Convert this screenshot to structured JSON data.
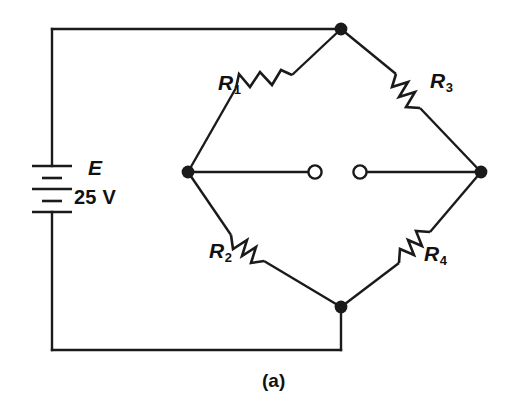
{
  "figure": {
    "kind": "schematic-diagram",
    "caption": "(a)",
    "background_color": "#ffffff",
    "line_color": "#1a1a1a"
  },
  "source": {
    "symbol": "E",
    "value": "25 V",
    "type": "battery"
  },
  "resistors": [
    {
      "id": "R1",
      "label": "R",
      "subscript": "1",
      "position": "upper-left"
    },
    {
      "id": "R2",
      "label": "R",
      "subscript": "2",
      "position": "lower-left"
    },
    {
      "id": "R3",
      "label": "R",
      "subscript": "3",
      "position": "upper-right"
    },
    {
      "id": "R4",
      "label": "R",
      "subscript": "4",
      "position": "lower-right"
    }
  ],
  "nodes": [
    {
      "id": "top",
      "x": 341,
      "y": 29
    },
    {
      "id": "left",
      "x": 188,
      "y": 172
    },
    {
      "id": "right",
      "x": 481,
      "y": 172
    },
    {
      "id": "bottom",
      "x": 341,
      "y": 307
    }
  ],
  "meter_terminals": [
    {
      "id": "terminal-left",
      "x": 315,
      "y": 172
    },
    {
      "id": "terminal-right",
      "x": 360,
      "y": 172
    }
  ]
}
